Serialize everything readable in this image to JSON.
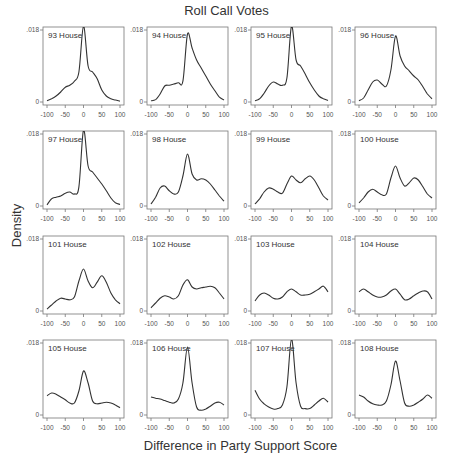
{
  "chart_data": {
    "type": "line",
    "title": "Roll Call Votes",
    "xlabel": "Difference in Party Support Score",
    "ylabel": "Density",
    "layout": {
      "rows": 4,
      "cols": 4,
      "grid": false,
      "legend": "none"
    },
    "xlim": [
      -100,
      100
    ],
    "ylim": [
      0,
      0.018
    ],
    "x_ticks": [
      -100,
      -50,
      0,
      50,
      100
    ],
    "x_tick_labels": [
      "-100",
      "-50",
      "0",
      "50",
      "100"
    ],
    "y_ticks": [
      0,
      0.018
    ],
    "y_tick_labels": [
      "0",
      ".018"
    ],
    "x": [
      -100,
      -87.5,
      -75,
      -62.5,
      -50,
      -37.5,
      -25,
      -12.5,
      0,
      12.5,
      25,
      37.5,
      50,
      62.5,
      75,
      87.5,
      100
    ],
    "panels": [
      {
        "title": "93 House",
        "values": [
          0.0003,
          0.0008,
          0.0015,
          0.0025,
          0.0037,
          0.0042,
          0.0052,
          0.0075,
          0.019,
          0.009,
          0.0075,
          0.0058,
          0.003,
          0.0015,
          0.0008,
          0.0005,
          0.0002
        ]
      },
      {
        "title": "94 House",
        "values": [
          0.0003,
          0.0006,
          0.002,
          0.004,
          0.0042,
          0.0045,
          0.0048,
          0.0052,
          0.017,
          0.0135,
          0.0105,
          0.0085,
          0.0065,
          0.0045,
          0.0028,
          0.0012,
          0.0005
        ]
      },
      {
        "title": "95 House",
        "values": [
          0.0003,
          0.0008,
          0.0022,
          0.004,
          0.005,
          0.0045,
          0.0042,
          0.006,
          0.019,
          0.0105,
          0.009,
          0.007,
          0.0048,
          0.003,
          0.0015,
          0.0008,
          0.0004
        ]
      },
      {
        "title": "96 House",
        "values": [
          0.0003,
          0.001,
          0.003,
          0.005,
          0.0055,
          0.0045,
          0.004,
          0.008,
          0.0165,
          0.0115,
          0.009,
          0.0078,
          0.0065,
          0.0055,
          0.0038,
          0.002,
          0.0008
        ]
      },
      {
        "title": "97 House",
        "values": [
          0.0003,
          0.0018,
          0.0022,
          0.0025,
          0.0032,
          0.0035,
          0.003,
          0.0048,
          0.019,
          0.01,
          0.0085,
          0.007,
          0.0055,
          0.0038,
          0.002,
          0.0008,
          0.0004
        ]
      },
      {
        "title": "98 House",
        "values": [
          0.0005,
          0.0022,
          0.0045,
          0.005,
          0.0038,
          0.003,
          0.0035,
          0.0075,
          0.013,
          0.008,
          0.0065,
          0.0068,
          0.0065,
          0.0055,
          0.004,
          0.0025,
          0.0012
        ]
      },
      {
        "title": "99 House",
        "values": [
          0.0005,
          0.0018,
          0.0035,
          0.0045,
          0.0042,
          0.0035,
          0.0032,
          0.0055,
          0.0075,
          0.0065,
          0.0058,
          0.0068,
          0.0075,
          0.0065,
          0.0045,
          0.0025,
          0.0015
        ]
      },
      {
        "title": "100 House",
        "values": [
          0.0008,
          0.002,
          0.0035,
          0.0042,
          0.0035,
          0.0028,
          0.003,
          0.007,
          0.01,
          0.007,
          0.005,
          0.0058,
          0.007,
          0.0065,
          0.0048,
          0.003,
          0.002
        ]
      },
      {
        "title": "101 House",
        "values": [
          0.0005,
          0.0015,
          0.0025,
          0.0032,
          0.003,
          0.0028,
          0.0035,
          0.0075,
          0.0105,
          0.0075,
          0.0058,
          0.0072,
          0.0088,
          0.0072,
          0.0045,
          0.0028,
          0.0018
        ]
      },
      {
        "title": "102 House",
        "values": [
          0.0008,
          0.002,
          0.0032,
          0.0038,
          0.0035,
          0.003,
          0.0038,
          0.0065,
          0.0078,
          0.006,
          0.0055,
          0.0058,
          0.006,
          0.0062,
          0.0058,
          0.0045,
          0.003
        ]
      },
      {
        "title": "103 House",
        "values": [
          0.0025,
          0.004,
          0.0045,
          0.004,
          0.0032,
          0.003,
          0.0035,
          0.0048,
          0.0055,
          0.0048,
          0.004,
          0.004,
          0.0042,
          0.0048,
          0.0055,
          0.0062,
          0.0048
        ]
      },
      {
        "title": "104 House",
        "values": [
          0.0048,
          0.0055,
          0.0048,
          0.004,
          0.0035,
          0.0035,
          0.004,
          0.005,
          0.0055,
          0.0042,
          0.0028,
          0.003,
          0.0038,
          0.0045,
          0.005,
          0.0048,
          0.003
        ]
      },
      {
        "title": "105 House",
        "values": [
          0.0048,
          0.0055,
          0.0052,
          0.0045,
          0.0038,
          0.003,
          0.003,
          0.006,
          0.011,
          0.008,
          0.0035,
          0.0028,
          0.003,
          0.0032,
          0.003,
          0.0025,
          0.0018
        ]
      },
      {
        "title": "106 House",
        "values": [
          0.0045,
          0.0042,
          0.004,
          0.0036,
          0.0032,
          0.003,
          0.004,
          0.008,
          0.017,
          0.008,
          0.002,
          0.0012,
          0.0015,
          0.0022,
          0.003,
          0.0032,
          0.0025
        ]
      },
      {
        "title": "107 House",
        "values": [
          0.0062,
          0.004,
          0.0028,
          0.002,
          0.0015,
          0.0016,
          0.0025,
          0.007,
          0.019,
          0.008,
          0.0022,
          0.0016,
          0.0016,
          0.0025,
          0.0035,
          0.0042,
          0.0032
        ]
      },
      {
        "title": "108 House",
        "values": [
          0.005,
          0.0045,
          0.0035,
          0.0028,
          0.0025,
          0.0025,
          0.0035,
          0.0075,
          0.0135,
          0.0085,
          0.003,
          0.0022,
          0.0025,
          0.0032,
          0.004,
          0.005,
          0.0042
        ]
      }
    ]
  },
  "footer_text": ""
}
